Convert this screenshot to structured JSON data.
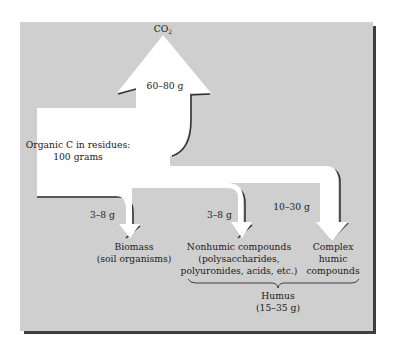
{
  "diagram": {
    "colors": {
      "background": "#ffffff",
      "panel": "#cfcfcf",
      "panel_shadow": "#3e3e3e",
      "arrow_fill": "#ffffff",
      "arrow_shadow": "#333333",
      "text": "#1a1a1a"
    },
    "source": {
      "label_line1": "Organic C in residues:",
      "label_line2": "100 grams"
    },
    "outputs": {
      "co2": {
        "label_main": "CO",
        "label_sub": "2",
        "amount": "60–80 g"
      },
      "biomass": {
        "amount": "3–8 g",
        "label_line1": "Biomass",
        "label_line2": "(soil organisms)"
      },
      "nonhumic": {
        "amount": "3–8 g",
        "label_line1": "Nonhumic compounds",
        "label_line2": "(polysaccharides,",
        "label_line3": "polyuronides, acids, etc.)"
      },
      "humic": {
        "amount": "10–30 g",
        "label_line1": "Complex",
        "label_line2": "humic",
        "label_line3": "compounds"
      }
    },
    "humus_group": {
      "label_line1": "Humus",
      "label_line2": "(15–35 g)",
      "brace_icon": "curly-brace"
    },
    "icons": {
      "co2_arrow": "arrow-up-icon",
      "biomass_arrow": "arrow-down-icon",
      "nonhumic_arrow": "arrow-down-icon",
      "humic_arrow": "arrow-down-icon"
    }
  }
}
